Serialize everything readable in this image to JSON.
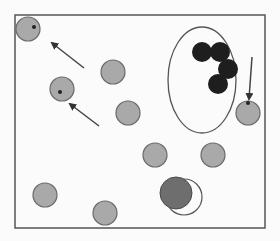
{
  "diagram": {
    "colors": {
      "background": "#fbfbfb",
      "frame": "#555555",
      "gray_particle": "#a9a9a9",
      "gray_particle_stroke": "#6a6a6a",
      "black_particle": "#1e1e1e",
      "dark_particle": "#6e6e6e",
      "arrow": "#444444",
      "marker_dot": "#222222"
    },
    "gray_particles": [
      {
        "id": "p1",
        "has_dot": true
      },
      {
        "id": "p2",
        "has_dot": true
      },
      {
        "id": "p3",
        "has_dot": false
      },
      {
        "id": "p4",
        "has_dot": false
      },
      {
        "id": "p5",
        "has_dot": false
      },
      {
        "id": "p6",
        "has_dot": false
      },
      {
        "id": "p7",
        "has_dot": true
      },
      {
        "id": "p8",
        "has_dot": false
      },
      {
        "id": "p9",
        "has_dot": false
      }
    ],
    "black_cluster_count": 4,
    "arrows_count": 3,
    "large_particle": {
      "has_outline_ring": true
    }
  }
}
